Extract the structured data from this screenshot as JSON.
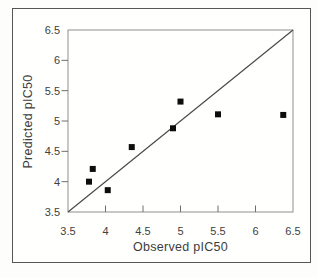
{
  "figure": {
    "kind": "scanned-figure",
    "background_color": "#fdfdfb",
    "frame_border_color": "#565656",
    "plot_box_color": "#8f8f8f",
    "tick_color": "#6e6e6e",
    "text_color": "#414141"
  },
  "chart_data": {
    "type": "scatter",
    "title": "",
    "xlabel": "Observed pIC50",
    "ylabel": "Predicted pIC50",
    "xlim": [
      3.5,
      6.5
    ],
    "ylim": [
      3.5,
      6.5
    ],
    "x_ticks": [
      3.5,
      4,
      4.5,
      5,
      5.5,
      6,
      6.5
    ],
    "y_ticks": [
      3.5,
      4,
      4.5,
      5,
      5.5,
      6,
      6.5
    ],
    "grid": false,
    "legend": false,
    "marker": {
      "shape": "square",
      "color": "#0d0d0d",
      "size": 6
    },
    "series": [
      {
        "name": "predicted-vs-observed",
        "points": [
          {
            "x": 3.78,
            "y": 4.0
          },
          {
            "x": 3.83,
            "y": 4.21
          },
          {
            "x": 4.03,
            "y": 3.86
          },
          {
            "x": 4.35,
            "y": 4.57
          },
          {
            "x": 4.9,
            "y": 4.88
          },
          {
            "x": 5.0,
            "y": 5.32
          },
          {
            "x": 5.5,
            "y": 5.11
          },
          {
            "x": 6.37,
            "y": 5.1
          }
        ]
      }
    ],
    "reference_line": {
      "type": "identity",
      "from": [
        3.5,
        3.5
      ],
      "to": [
        6.5,
        6.5
      ],
      "color": "#4a4a4a"
    }
  }
}
